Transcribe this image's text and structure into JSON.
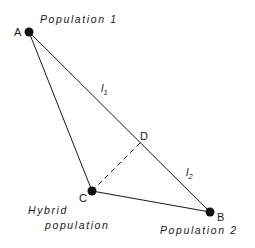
{
  "diagram": {
    "points": {
      "A": {
        "label": "A",
        "x": 29,
        "y": 32
      },
      "B": {
        "label": "B",
        "x": 210,
        "y": 212
      },
      "C": {
        "label": "C",
        "x": 92,
        "y": 191
      },
      "D": {
        "label": "D",
        "x": 140,
        "y": 143
      }
    },
    "population_labels": {
      "pop1": "Population 1",
      "pop2": "Population 2",
      "hybrid_line1": "Hybrid",
      "hybrid_line2": "population"
    },
    "segment_labels": {
      "l1": {
        "main": "l",
        "sub": "1"
      },
      "l2": {
        "main": "l",
        "sub": "2"
      }
    },
    "edges": [
      {
        "from": "A",
        "to": "B",
        "style": "solid"
      },
      {
        "from": "A",
        "to": "C",
        "style": "solid"
      },
      {
        "from": "C",
        "to": "B",
        "style": "solid"
      },
      {
        "from": "C",
        "to": "D",
        "style": "dashed"
      }
    ],
    "colors": {
      "ink": "#1a1a1a",
      "background": "#ffffff"
    }
  }
}
